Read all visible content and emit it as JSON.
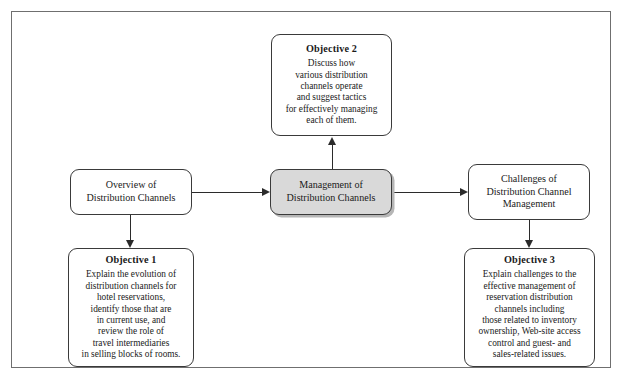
{
  "diagram": {
    "nodes": {
      "overview": {
        "text": "Overview of\nDistribution Channels"
      },
      "management": {
        "text": "Management of\nDistribution Channels",
        "fill_color": "#d9d9d9"
      },
      "challenges": {
        "text": "Challenges of\nDistribution Channel\nManagement"
      },
      "objective_1": {
        "title": "Objective 1",
        "body": "Explain the evolution of\ndistribution channels for\nhotel reservations,\nidentify those that are\nin current use, and\nreview the role of\ntravel intermediaries\nin selling blocks of rooms."
      },
      "objective_2": {
        "title": "Objective 2",
        "body": "Discuss how\nvarious distribution\nchannels operate\nand suggest tactics\nfor effectively managing\neach of them."
      },
      "objective_3": {
        "title": "Objective 3",
        "body": "Explain challenges to the\neffective management of\nreservation distribution\nchannels including\nthose related to inventory\nownership, Web-site access\ncontrol and guest- and\nsales-related issues."
      }
    },
    "edges": {
      "overview_to_management": "arrow-right",
      "management_to_challenges": "arrow-right",
      "overview_to_objective_1": "arrow-down",
      "management_to_objective_2": "arrow-up",
      "challenges_to_objective_3": "arrow-down"
    },
    "colors": {
      "frame_border": "#6f6f6f",
      "node_border": "#3a3a3a",
      "connector": "#2b2b2b",
      "shaded_fill": "#d9d9d9",
      "background": "#ffffff"
    }
  }
}
